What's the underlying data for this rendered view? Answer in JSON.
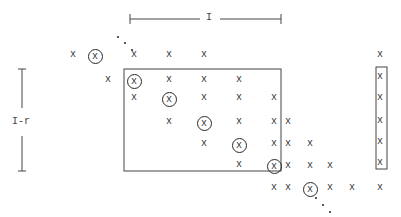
{
  "diagram": {
    "type": "sparse-matrix-structure",
    "top_brace": {
      "label": "I",
      "x1": 130,
      "x2": 281,
      "y": 19
    },
    "left_brace": {
      "label": "I-r",
      "x": 22,
      "y1": 69,
      "y2": 171
    },
    "main_box": {
      "left": 124,
      "top": 69,
      "right": 281,
      "bottom": 171
    },
    "right_box": {
      "left": 376,
      "top": 67,
      "right": 387,
      "bottom": 169
    },
    "entry_glyph": "x",
    "entries": [
      {
        "x": 73,
        "y": 56,
        "circled": false
      },
      {
        "x": 95,
        "y": 56,
        "circled": true
      },
      {
        "x": 134,
        "y": 56,
        "circled": false
      },
      {
        "x": 169,
        "y": 56,
        "circled": false
      },
      {
        "x": 204,
        "y": 56,
        "circled": false
      },
      {
        "x": 380,
        "y": 56,
        "circled": false
      },
      {
        "x": 108,
        "y": 81,
        "circled": false
      },
      {
        "x": 134,
        "y": 81,
        "circled": true
      },
      {
        "x": 169,
        "y": 81,
        "circled": false
      },
      {
        "x": 204,
        "y": 81,
        "circled": false
      },
      {
        "x": 239,
        "y": 81,
        "circled": false
      },
      {
        "x": 380,
        "y": 78,
        "circled": false
      },
      {
        "x": 134,
        "y": 99,
        "circled": false
      },
      {
        "x": 169,
        "y": 99,
        "circled": true
      },
      {
        "x": 204,
        "y": 99,
        "circled": false
      },
      {
        "x": 239,
        "y": 99,
        "circled": false
      },
      {
        "x": 274,
        "y": 99,
        "circled": false
      },
      {
        "x": 380,
        "y": 99,
        "circled": false
      },
      {
        "x": 169,
        "y": 123,
        "circled": false
      },
      {
        "x": 204,
        "y": 123,
        "circled": true
      },
      {
        "x": 239,
        "y": 123,
        "circled": false
      },
      {
        "x": 274,
        "y": 123,
        "circled": false
      },
      {
        "x": 288,
        "y": 123,
        "circled": false
      },
      {
        "x": 380,
        "y": 122,
        "circled": false
      },
      {
        "x": 204,
        "y": 145,
        "circled": false
      },
      {
        "x": 239,
        "y": 145,
        "circled": true
      },
      {
        "x": 274,
        "y": 145,
        "circled": false
      },
      {
        "x": 288,
        "y": 145,
        "circled": false
      },
      {
        "x": 310,
        "y": 145,
        "circled": false
      },
      {
        "x": 380,
        "y": 143,
        "circled": false
      },
      {
        "x": 239,
        "y": 166,
        "circled": false
      },
      {
        "x": 274,
        "y": 166,
        "circled": true
      },
      {
        "x": 288,
        "y": 167,
        "circled": false
      },
      {
        "x": 310,
        "y": 167,
        "circled": false
      },
      {
        "x": 330,
        "y": 167,
        "circled": false
      },
      {
        "x": 380,
        "y": 164,
        "circled": false
      },
      {
        "x": 274,
        "y": 189,
        "circled": false
      },
      {
        "x": 288,
        "y": 189,
        "circled": false
      },
      {
        "x": 310,
        "y": 189,
        "circled": true
      },
      {
        "x": 330,
        "y": 189,
        "circled": false
      },
      {
        "x": 352,
        "y": 189,
        "circled": false
      },
      {
        "x": 380,
        "y": 189,
        "circled": false
      }
    ],
    "dots_top": [
      [
        118,
        37
      ],
      [
        125,
        43
      ],
      [
        132,
        50
      ]
    ],
    "dots_bottom": [
      [
        316,
        198
      ],
      [
        323,
        205
      ],
      [
        330,
        212
      ]
    ]
  }
}
